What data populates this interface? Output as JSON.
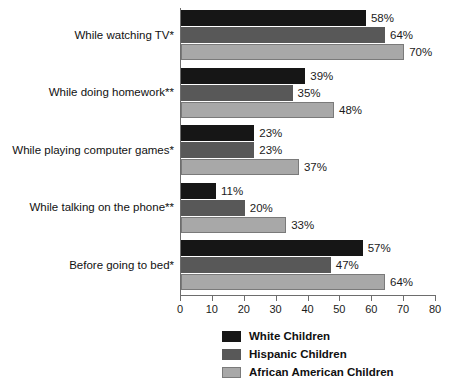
{
  "chart_data": {
    "type": "bar",
    "orientation": "horizontal",
    "title": "",
    "subtitle": "",
    "xlabel": "",
    "ylabel": "",
    "xlim": [
      0,
      80
    ],
    "xticks": [
      0,
      10,
      20,
      30,
      40,
      50,
      60,
      70,
      80
    ],
    "xtick_labels": [
      "0",
      "10",
      "20",
      "30",
      "40",
      "50",
      "60",
      "70",
      "80"
    ],
    "grid": false,
    "legend_position": "bottom-center",
    "value_label_suffix": "%",
    "categories": [
      "While watching TV*",
      "While doing homework**",
      "While playing computer games*",
      "While talking on the phone**",
      "Before going to bed*"
    ],
    "series": [
      {
        "name": "White Children",
        "color": "#161616",
        "values": [
          58,
          39,
          23,
          11,
          57
        ],
        "value_labels": [
          "58%",
          "39%",
          "23%",
          "11%",
          "57%"
        ]
      },
      {
        "name": "Hispanic Children",
        "color": "#585858",
        "values": [
          64,
          35,
          23,
          20,
          47
        ],
        "value_labels": [
          "64%",
          "35%",
          "23%",
          "20%",
          "47%"
        ]
      },
      {
        "name": "African American Children",
        "color": "#a8a8a8",
        "values": [
          70,
          48,
          37,
          33,
          64
        ],
        "value_labels": [
          "70%",
          "48%",
          "37%",
          "33%",
          "64%"
        ]
      }
    ]
  },
  "legend": {
    "items": [
      {
        "label": "White Children",
        "color": "#161616"
      },
      {
        "label": "Hispanic Children",
        "color": "#585858"
      },
      {
        "label": "African American Children",
        "color": "#a8a8a8"
      }
    ]
  },
  "axis": {
    "tick_labels": [
      "0",
      "10",
      "20",
      "30",
      "40",
      "50",
      "60",
      "70",
      "80"
    ]
  }
}
